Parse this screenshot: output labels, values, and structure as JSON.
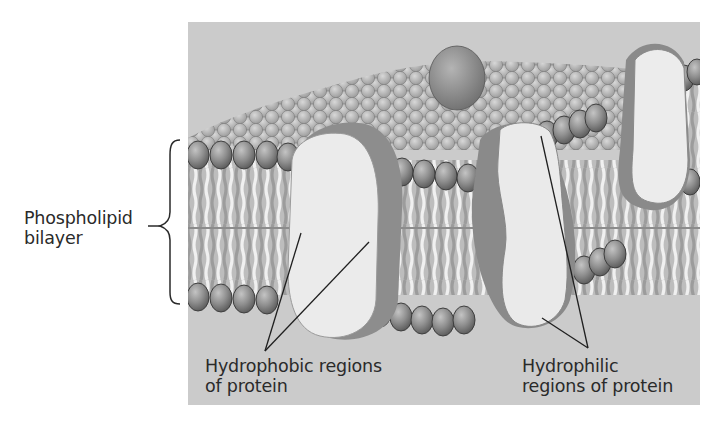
{
  "figure": {
    "colors": {
      "background_panel": "#c9c9c9",
      "head_fill": "#8e8e8e",
      "head_stroke": "#4a4a4a",
      "tail_light": "#e6e6e6",
      "tail_dark": "#9a9a9a",
      "protein_face": "#e9e9e9",
      "protein_side": "#8a8a8a",
      "label_text": "#2a2a2a"
    }
  },
  "labels": {
    "bilayer": {
      "line1": "Phospholipid",
      "line2": "bilayer"
    },
    "hydrophobic": {
      "line1": "Hydrophobic regions",
      "line2": "of protein"
    },
    "hydrophilic": {
      "line1": "Hydrophilic",
      "line2": "regions of protein"
    }
  }
}
